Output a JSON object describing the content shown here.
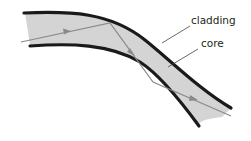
{
  "diagram": {
    "labels": {
      "cladding": "cladding",
      "core": "core"
    },
    "colors": {
      "core_fill": "#d4d4d4",
      "cladding_stroke": "#1a1a1a",
      "ray": "#8a8a8a",
      "leader": "#444444"
    }
  }
}
